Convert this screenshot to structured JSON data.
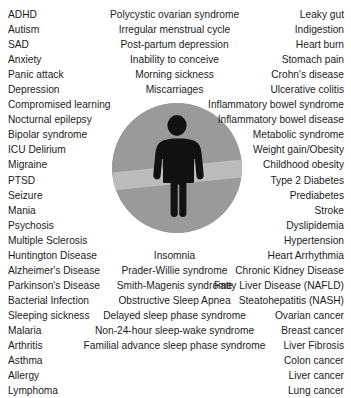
{
  "figure": {
    "icon": "person-pictogram-icon",
    "circle_color": "#9a9a9a",
    "band_color": "#b9b9b9",
    "person_color": "#121212",
    "background_color": "#ffffff"
  },
  "columns": {
    "left": [
      "ADHD",
      "Autism",
      "SAD",
      "Anxiety",
      "Panic attack",
      "Depression",
      "Compromised learning",
      "Nocturnal epilepsy",
      "Bipolar syndrome",
      "ICU Delirium",
      "Migraine",
      "PTSD",
      "Seizure",
      "Mania",
      "Psychosis",
      "Multiple Sclerosis",
      "Huntington Disease",
      "Alzheimer's Disease",
      "Parkinson's Disease",
      "Bacterial Infection",
      "Sleeping sickness",
      "Malaria",
      "Arthritis",
      "Asthma",
      "Allergy",
      "Lymphoma"
    ],
    "middle_top": [
      "Polycystic ovarian syndrome",
      "Irregular menstrual cycle",
      "Post-partum depression",
      "Inability to conceive",
      "Morning sickness",
      "Miscarriages"
    ],
    "middle_bottom": [
      "Insomnia",
      "Prader-Willie syndrome",
      "Smith-Magenis syndrome",
      "Obstructive Sleep Apnea",
      "Delayed sleep phase syndrome",
      "Non-24-hour sleep-wake syndrome",
      "Familial advance sleep phase syndrome"
    ],
    "right": [
      "Leaky gut",
      "Indigestion",
      "Heart burn",
      "Stomach pain",
      "Crohn's disease",
      "Ulcerative colitis",
      "Inflammatory bowel syndrome",
      "Inflammatory bowel disease",
      "Metabolic syndrome",
      "Weight gain/Obesity",
      "Childhood obesity",
      "Type 2 Diabetes",
      "Prediabetes",
      "Stroke",
      "Dyslipidemia",
      "Hypertension",
      "Heart Arrhythmia",
      "Chronic Kidney Disease",
      "Fatty Liver Disease (NAFLD)",
      "Steatohepatitis (NASH)",
      "Ovarian cancer",
      "Breast cancer",
      "Liver Fibrosis",
      "Colon cancer",
      "Liver cancer",
      "Lung cancer"
    ]
  }
}
